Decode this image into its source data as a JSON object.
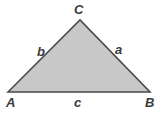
{
  "figure": {
    "type": "geometry-diagram",
    "shape": "triangle",
    "background_color": "#ffffff",
    "fill_color": "#c8c8c8",
    "stroke_color": "#4a4a4a",
    "stroke_width": 1.6,
    "label_color": "#3b3b3b",
    "vertices": [
      {
        "id": "A",
        "label": "A",
        "x": 8,
        "y": 92
      },
      {
        "id": "B",
        "label": "B",
        "x": 150,
        "y": 92
      },
      {
        "id": "C",
        "label": "C",
        "x": 80,
        "y": 20
      }
    ],
    "sides": [
      {
        "id": "a",
        "label": "a",
        "between": "B-C"
      },
      {
        "id": "b",
        "label": "b",
        "between": "A-C"
      },
      {
        "id": "c",
        "label": "c",
        "between": "A-B"
      }
    ],
    "polygon_points": "8,92 80,20 150,92"
  }
}
